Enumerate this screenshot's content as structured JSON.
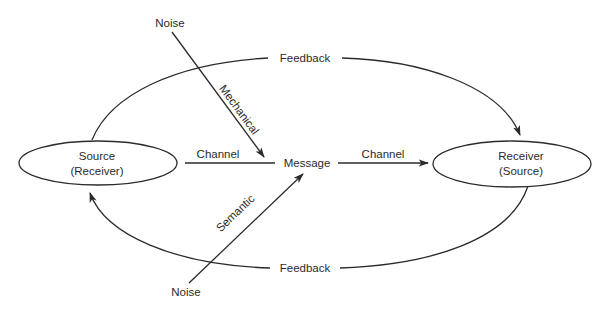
{
  "diagram": {
    "nodes": {
      "source": {
        "line1": "Source",
        "line2": "(Receiver)"
      },
      "message": {
        "label": "Message"
      },
      "receiver": {
        "line1": "Receiver",
        "line2": "(Source)"
      },
      "noise_top": {
        "label": "Noise"
      },
      "noise_bottom": {
        "label": "Noise"
      }
    },
    "edges": {
      "channel_left": {
        "label": "Channel",
        "from": "Source",
        "to": "Message"
      },
      "channel_right": {
        "label": "Channel",
        "from": "Message",
        "to": "Receiver"
      },
      "feedback_top": {
        "label": "Feedback",
        "from": "Source",
        "to": "Receiver"
      },
      "feedback_bottom": {
        "label": "Feedback",
        "from": "Receiver",
        "to": "Source"
      },
      "mechanical": {
        "label": "Mechanical",
        "from": "Noise",
        "to": "Message"
      },
      "semantic": {
        "label": "Semantic",
        "from": "Noise",
        "to": "Message"
      }
    },
    "colors": {
      "stroke": "#2b2b2b",
      "background": "#ffffff"
    }
  }
}
